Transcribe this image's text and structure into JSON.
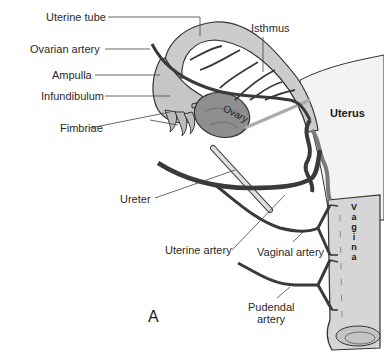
{
  "figure": {
    "panel_letter": "A",
    "labels": {
      "uterine_tube": "Uterine tube",
      "ovarian_artery": "Ovarian artery",
      "ampulla": "Ampulla",
      "infundibulum": "Infundibulum",
      "fimbriae": "Fimbriae",
      "isthmus": "Isthmus",
      "ovary": "Ovary",
      "uterus": "Uterus",
      "ureter": "Ureter",
      "uterine_artery": "Uterine artery",
      "vaginal_artery": "Vaginal artery",
      "pudendal_artery_line1": "Pudendal",
      "pudendal_artery_line2": "artery",
      "vagina_letters": [
        "V",
        "a",
        "g",
        "i",
        "n",
        "a"
      ]
    },
    "colors": {
      "background": "#ffffff",
      "artery": "#3a3a3a",
      "tube_fill": "#c8c8c8",
      "ovary_fill": "#8a8a8a",
      "uterus_fill": "#f2f2f2",
      "vagina_fill": "#d4d4d4",
      "leader_line": "#444444",
      "text": "#2a2a2a"
    }
  }
}
